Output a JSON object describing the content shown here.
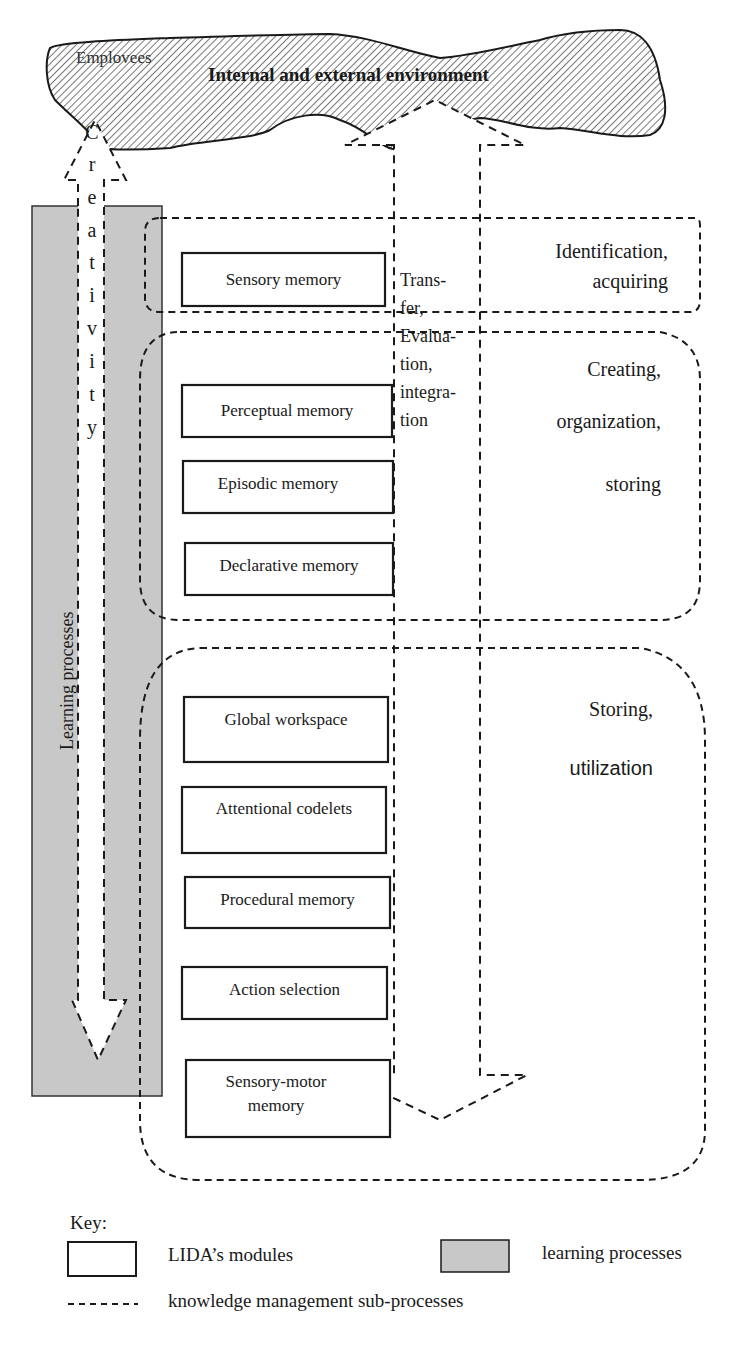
{
  "environment": {
    "title": "Internal and external environment",
    "employees_label": "Emplovees"
  },
  "creativity": {
    "letters": [
      "C",
      "r",
      "e",
      "a",
      "t",
      "i",
      "v",
      "i",
      "t",
      "y"
    ]
  },
  "learning_processes": {
    "label": "Learning processes",
    "fill_color": "#c8c8c8"
  },
  "transfer_label": {
    "lines": [
      "Trans-",
      "fer,",
      "Evalua-",
      "tion,",
      "integra-",
      "tion"
    ]
  },
  "modules": [
    {
      "label": "Sensory memory"
    },
    {
      "label": "Perceptual memory"
    },
    {
      "label": "Episodic memory"
    },
    {
      "label": "Declarative memory"
    },
    {
      "label": "Global workspace"
    },
    {
      "label": "Attentional codelets"
    },
    {
      "label": "Procedural memory"
    },
    {
      "label": "Action selection"
    },
    {
      "label": "Sensory-motor",
      "label2": "memory"
    }
  ],
  "phases": [
    {
      "lines": [
        "Identification,",
        "acquiring"
      ]
    },
    {
      "lines": [
        "Creating,",
        "organization,",
        "storing"
      ]
    },
    {
      "lines": [
        "Storing,",
        "utilization"
      ]
    }
  ],
  "key": {
    "title": "Key:",
    "modules_label": "LIDA’s modules",
    "learning_label": "learning processes",
    "km_label": "knowledge management sub-processes"
  }
}
